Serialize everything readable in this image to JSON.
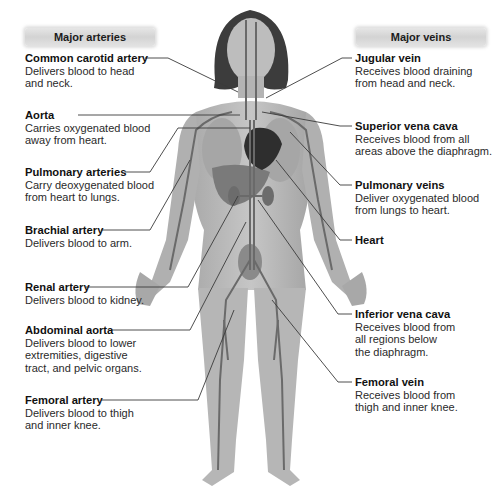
{
  "headers": {
    "arteries": "Major arteries",
    "veins": "Major veins"
  },
  "arteries": [
    {
      "title": "Common carotid artery",
      "desc1": "Delivers blood to head",
      "desc2": "and neck."
    },
    {
      "title": "Aorta",
      "desc1": "Carries oxygenated blood",
      "desc2": "away from heart."
    },
    {
      "title": "Pulmonary arteries",
      "desc1": "Carry deoxygenated blood",
      "desc2": "from heart to lungs."
    },
    {
      "title": "Brachial artery",
      "desc1": "Delivers blood to arm.",
      "desc2": ""
    },
    {
      "title": "Renal artery",
      "desc1": "Delivers blood to kidney.",
      "desc2": ""
    },
    {
      "title": "Abdominal aorta",
      "desc1": "Delivers blood to lower",
      "desc2": "extremities, digestive",
      "desc3": "tract, and pelvic organs."
    },
    {
      "title": "Femoral artery",
      "desc1": "Delivers blood to thigh",
      "desc2": "and inner knee."
    }
  ],
  "veins": [
    {
      "title": "Jugular vein",
      "desc1": "Receives blood draining",
      "desc2": "from head and neck."
    },
    {
      "title": "Superior vena cava",
      "desc1": "Receives blood from all",
      "desc2": "areas above the diaphragm."
    },
    {
      "title": "Pulmonary veins",
      "desc1": "Deliver oxygenated blood",
      "desc2": "from lungs to heart."
    },
    {
      "title": "Heart",
      "desc1": "",
      "desc2": ""
    },
    {
      "title": "Inferior vena cava",
      "desc1": "Receives blood from",
      "desc2": "all regions below",
      "desc3": "the diaphragm."
    },
    {
      "title": "Femoral vein",
      "desc1": "Receives blood from",
      "desc2": "thigh and inner knee."
    }
  ],
  "colors": {
    "skin": "#b8b8b8",
    "vessel": "#6e6e6e",
    "hair": "#3a3a3a",
    "leader_line": "#333333",
    "pill_bg": "#dcdcdc"
  }
}
